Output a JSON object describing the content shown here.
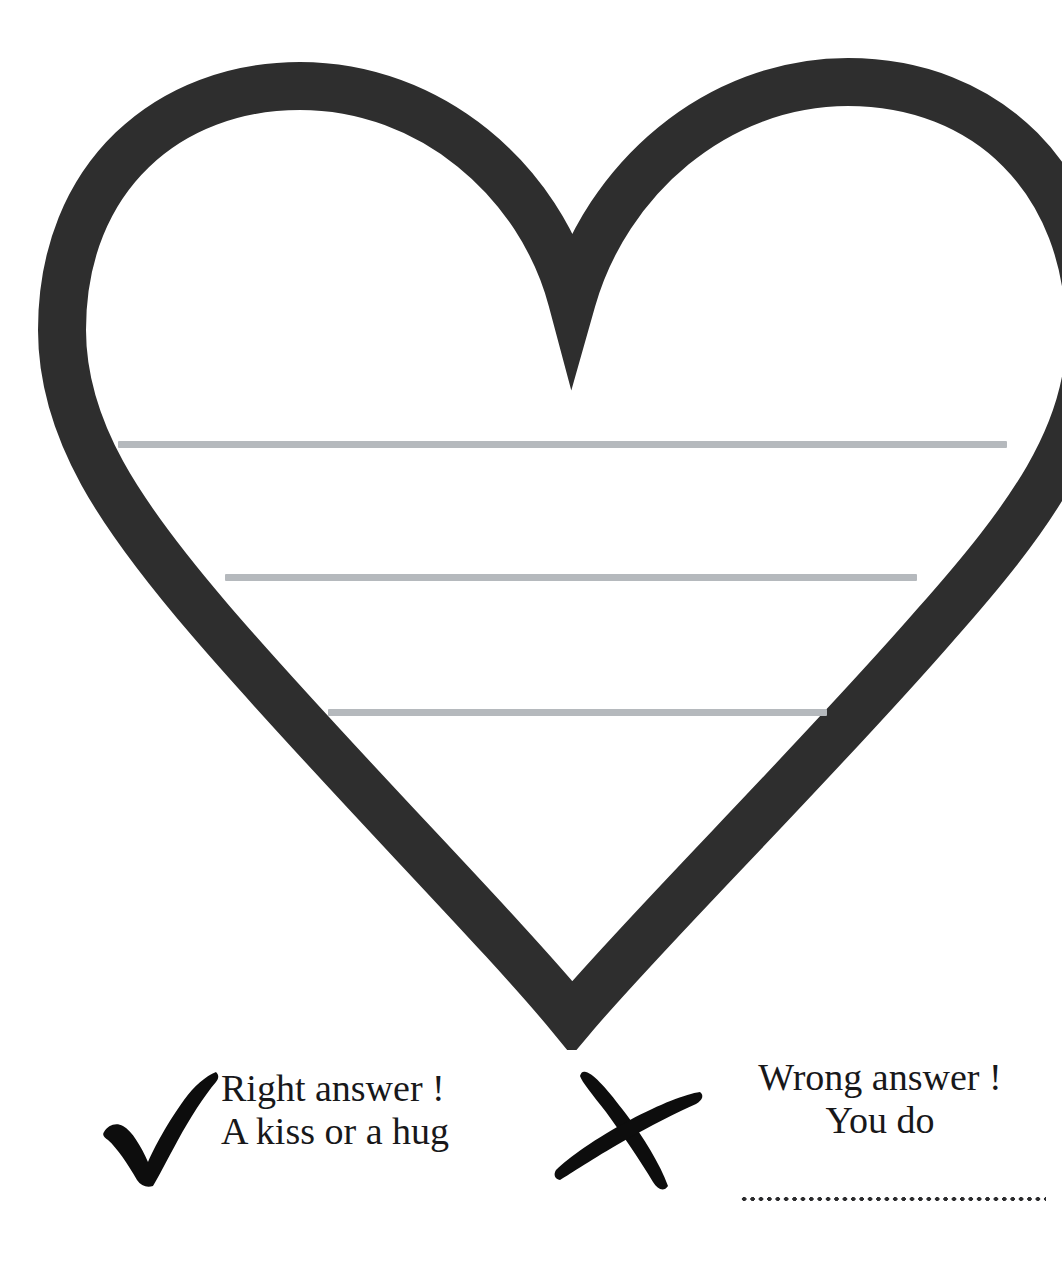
{
  "page": {
    "background_color": "#ffffff",
    "width": 1062,
    "height": 1277
  },
  "heart": {
    "name": "heart-outline",
    "stroke_color": "#2e2e2e",
    "fill_color": "#ffffff",
    "stroke_width": 48,
    "description": "Large hand-drawn heart outline occupying the upper portion of the page, clipped at the right edge"
  },
  "writing_lines": {
    "color": "#b5b9bd",
    "count": 3,
    "lines": [
      {
        "label": "writing-line-1",
        "left": 118,
        "top": 441,
        "width": 889
      },
      {
        "label": "writing-line-2",
        "left": 225,
        "top": 574,
        "width": 692
      },
      {
        "label": "writing-line-3",
        "left": 328,
        "top": 709,
        "width": 499
      }
    ]
  },
  "legend": {
    "correct": {
      "icon": "check-mark-icon",
      "icon_color": "#0d0d0d",
      "line1": "Right answer !",
      "line2": "A kiss or a hug"
    },
    "incorrect": {
      "icon": "cross-mark-icon",
      "icon_color": "#0d0d0d",
      "line1": "Wrong answer !",
      "line2": "You do",
      "blank_line": "dotted-fill-in-line",
      "blank_line_color": "#2b2b2d"
    }
  }
}
